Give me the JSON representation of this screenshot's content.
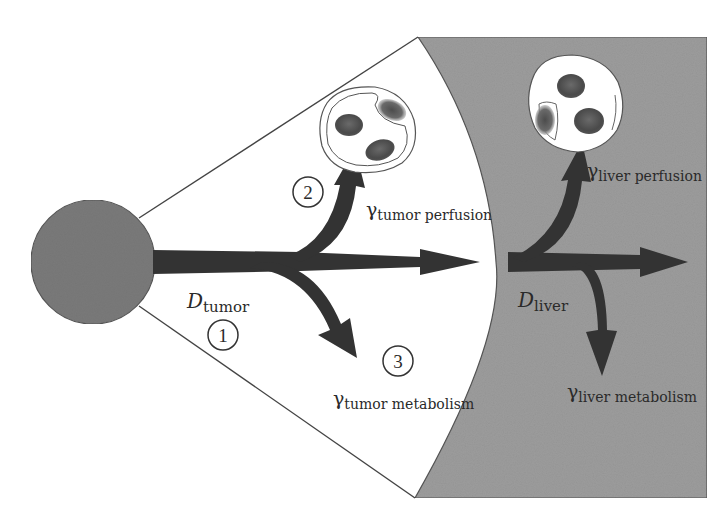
{
  "diagram": {
    "regions": {
      "tumor": {
        "name": "tumor region",
        "fill": "#ffffff"
      },
      "liver": {
        "name": "liver region",
        "fill": "#9c9c9c"
      }
    },
    "source": {
      "name": "tumor mass",
      "fill": "#7a7a7a"
    },
    "arrow_color": "#333333",
    "labels": {
      "d_tumor": {
        "symbol": "D",
        "subscript": "tumor"
      },
      "d_liver": {
        "symbol": "D",
        "subscript": "liver"
      },
      "gamma_tumor_perfusion": {
        "symbol": "γ",
        "subscript": "tumor perfusion"
      },
      "gamma_tumor_metabolism": {
        "symbol": "γ",
        "subscript": "tumor metabolism"
      },
      "gamma_liver_perfusion": {
        "symbol": "γ",
        "subscript": "liver perfusion"
      },
      "gamma_liver_metabolism": {
        "symbol": "γ",
        "subscript": "liver metabolism"
      }
    },
    "markers": [
      {
        "id": "1",
        "label": "1"
      },
      {
        "id": "2",
        "label": "2"
      },
      {
        "id": "3",
        "label": "3"
      }
    ]
  }
}
